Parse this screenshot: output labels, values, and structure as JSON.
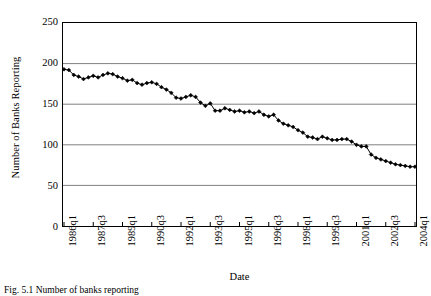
{
  "chart_data": {
    "type": "line",
    "title": "",
    "xlabel": "Date",
    "ylabel": "Number of Banks Reporting",
    "ylim": [
      0,
      250
    ],
    "yticks": [
      250,
      200,
      150,
      100,
      50,
      0
    ],
    "grid": "horizontal",
    "legend": "none",
    "marker": "diamond",
    "line_color": "#000000",
    "marker_color": "#000000",
    "grid_color": "#808080",
    "frame_color": "#000000",
    "background": "#ffffff",
    "xtick_labels": [
      "1986q1",
      "1987q3",
      "1989q1",
      "1990q3",
      "1992q1",
      "1993q3",
      "1995q1",
      "1996q3",
      "1998q1",
      "1999q3",
      "2001q1",
      "2002q3",
      "2004q1"
    ],
    "xtick_interval_quarters": 6,
    "x": [
      "1986q1",
      "1986q2",
      "1986q3",
      "1986q4",
      "1987q1",
      "1987q2",
      "1987q3",
      "1987q4",
      "1988q1",
      "1988q2",
      "1988q3",
      "1988q4",
      "1989q1",
      "1989q2",
      "1989q3",
      "1989q4",
      "1990q1",
      "1990q2",
      "1990q3",
      "1990q4",
      "1991q1",
      "1991q2",
      "1991q3",
      "1991q4",
      "1992q1",
      "1992q2",
      "1992q3",
      "1992q4",
      "1993q1",
      "1993q2",
      "1993q3",
      "1993q4",
      "1994q1",
      "1994q2",
      "1994q3",
      "1994q4",
      "1995q1",
      "1995q2",
      "1995q3",
      "1995q4",
      "1996q1",
      "1996q2",
      "1996q3",
      "1996q4",
      "1997q1",
      "1997q2",
      "1997q3",
      "1997q4",
      "1998q1",
      "1998q2",
      "1998q3",
      "1998q4",
      "1999q1",
      "1999q2",
      "1999q3",
      "1999q4",
      "2000q1",
      "2000q2",
      "2000q3",
      "2000q4",
      "2001q1",
      "2001q2",
      "2001q3",
      "2001q4",
      "2002q1",
      "2002q2",
      "2002q3",
      "2002q4",
      "2003q1",
      "2003q2",
      "2003q3",
      "2003q4",
      "2004q1"
    ],
    "values": [
      193,
      192,
      186,
      184,
      181,
      183,
      185,
      183,
      186,
      188,
      187,
      184,
      182,
      179,
      180,
      176,
      174,
      176,
      177,
      175,
      171,
      168,
      164,
      158,
      157,
      159,
      161,
      159,
      152,
      148,
      151,
      142,
      142,
      145,
      143,
      141,
      142,
      140,
      141,
      139,
      141,
      137,
      135,
      137,
      130,
      126,
      124,
      122,
      118,
      115,
      110,
      109,
      107,
      110,
      108,
      106,
      106,
      107,
      107,
      104,
      100,
      98,
      98,
      88,
      84,
      82,
      80,
      78,
      76,
      75,
      74,
      73,
      73
    ],
    "series_name": "Number of Banks Reporting"
  },
  "caption": {
    "text": "Fig. 5.1   Number of banks reporting"
  }
}
